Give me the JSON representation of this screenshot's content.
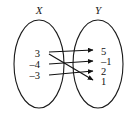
{
  "figure": {
    "kind": "mapping-diagram",
    "width": 131,
    "height": 114,
    "background_color": "#ffffff",
    "line_color": "#121212"
  },
  "domain_set": {
    "title": "X",
    "title_x": 39,
    "title_y": 14,
    "ellipse": {
      "cx": 39,
      "cy": 64,
      "rx": 25,
      "ry": 44
    },
    "elements": [
      {
        "label": "3",
        "x": 40,
        "y": 57,
        "anchor_x": 45,
        "anchor_y": 53
      },
      {
        "label": "–4",
        "x": 40,
        "y": 68,
        "anchor_x": 45,
        "anchor_y": 64
      },
      {
        "label": "–3",
        "x": 40,
        "y": 79,
        "anchor_x": 45,
        "anchor_y": 75
      }
    ]
  },
  "range_set": {
    "title": "Y",
    "title_x": 98,
    "title_y": 14,
    "ellipse": {
      "cx": 98,
      "cy": 64,
      "rx": 25,
      "ry": 44
    },
    "elements": [
      {
        "label": "5",
        "x": 101,
        "y": 55,
        "anchor_x": 95,
        "anchor_y": 51
      },
      {
        "label": "–1",
        "x": 101,
        "y": 65,
        "anchor_x": 95,
        "anchor_y": 61
      },
      {
        "label": "2",
        "x": 101,
        "y": 75,
        "anchor_x": 95,
        "anchor_y": 71
      },
      {
        "label": "1",
        "x": 101,
        "y": 85,
        "anchor_x": 95,
        "anchor_y": 81
      }
    ]
  },
  "mappings": [
    {
      "name": "arrow-3-to-5",
      "from": "3",
      "to": "5",
      "x1": 49,
      "y1": 52,
      "x2": 93,
      "y2": 50
    },
    {
      "name": "arrow-3-to-1",
      "from": "3",
      "to": "1",
      "x1": 49,
      "y1": 54,
      "x2": 93,
      "y2": 80
    },
    {
      "name": "arrow-neg4-to-neg1",
      "from": "–4",
      "to": "–1",
      "x1": 49,
      "y1": 64,
      "x2": 93,
      "y2": 61
    },
    {
      "name": "arrow-neg3-to-2",
      "from": "–3",
      "to": "2",
      "x1": 49,
      "y1": 75,
      "x2": 93,
      "y2": 71
    }
  ]
}
